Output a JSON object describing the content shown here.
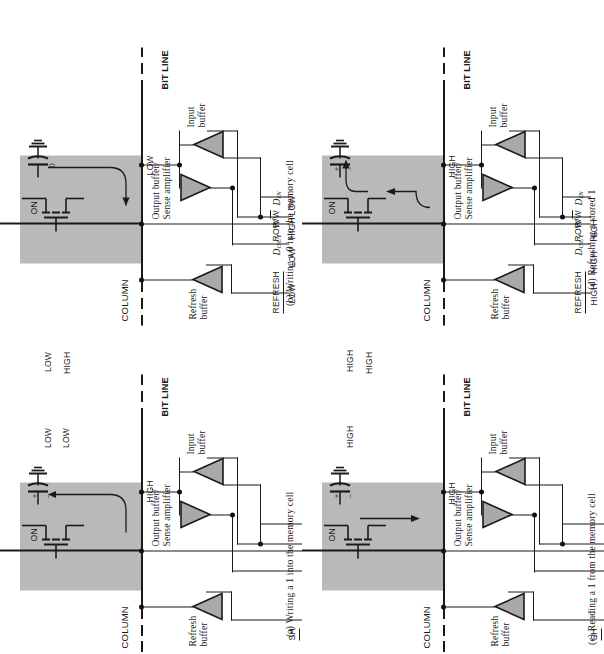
{
  "figure": {
    "shade_color": "#b9b9b9",
    "ink_color": "#1a1a1a"
  },
  "common_labels": {
    "column": "COLUMN",
    "bit_line": "BIT LINE",
    "refresh_buffer_l1": "Refresh",
    "refresh_buffer_l2": "buffer",
    "output_buffer_l1": "Output buffer/",
    "output_buffer_l2": "Sense amplifier",
    "input_buffer_l1": "Input",
    "input_buffer_l2": "buffer",
    "refresh_signal": "REFRESH",
    "row_signal": "ROW",
    "dout_signal": "D",
    "dout_sub": "OUT",
    "rw_signal_a": "R/",
    "rw_signal_b": "W",
    "din_signal": "D",
    "din_sub": "IN",
    "transistor_state": "ON"
  },
  "panels": [
    {
      "id": "a",
      "caption": "(a) Writing a 1 into the memory cell",
      "refresh_value": "",
      "row_value": "",
      "dout_value": "",
      "rw_value": "",
      "din_value": "",
      "bitline_value": "HIGH",
      "cap_label": "",
      "cap_state": "charged",
      "cap_plus": "+",
      "cap_minus": "−",
      "current_dir": "into-cell",
      "partial_signals": [
        "SH"
      ]
    },
    {
      "id": "b",
      "caption": "(b) Writing a 0 into the memory cell",
      "refresh_value": "LOW",
      "row_value": "HIGH",
      "dout_value": "LOW",
      "rw_value": "LOW",
      "din_value": "",
      "bitline_value": "LOW",
      "cap_label": "0",
      "cap_state": "discharged",
      "cap_plus": "",
      "cap_minus": "",
      "current_dir": "out-of-cell",
      "partial_signals": []
    },
    {
      "id": "c",
      "caption": "(c) Reading a 1 from the memory cell",
      "refresh_value": "HIGH",
      "row_value": "HIGH",
      "dout_value": "HIGH",
      "rw_value": "",
      "din_value": "",
      "bitline_value": "HIGH",
      "cap_label": "",
      "cap_state": "charged",
      "cap_plus": "+",
      "cap_minus": "−",
      "current_dir": "out-of-cell",
      "partial_signals": [
        "SH"
      ]
    },
    {
      "id": "d",
      "caption": "(d) Refreshing a stored 1",
      "refresh_value": "HIGH",
      "row_value": "HIGH",
      "dout_value": "HIGH",
      "rw_value": "",
      "din_value": "",
      "bitline_value": "HIGH",
      "cap_label": "",
      "cap_state": "charged",
      "cap_plus": "+",
      "cap_minus": "−",
      "current_dir": "into-cell",
      "partial_signals": []
    }
  ]
}
